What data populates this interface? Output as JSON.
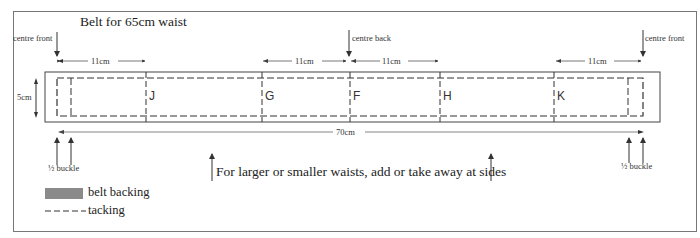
{
  "title": "Belt for 65cm waist",
  "labels": {
    "centre_front_left": "centre front",
    "centre_back": "centre back",
    "centre_front_right": "centre front",
    "height": "5cm",
    "total_length": "70cm",
    "half_buckle_left": "½ buckle",
    "half_buckle_right": "½ buckle",
    "note": "For larger or smaller waists, add or take away at sides"
  },
  "dimensions": [
    {
      "id": "front-left",
      "label": "11cm"
    },
    {
      "id": "back-left",
      "label": "11cm"
    },
    {
      "id": "back-right",
      "label": "11cm"
    },
    {
      "id": "front-right",
      "label": "11cm"
    }
  ],
  "markers": [
    "J",
    "G",
    "F",
    "H",
    "K"
  ],
  "legend": [
    {
      "label": "belt backing",
      "swatch": "#8a8a8a",
      "type": "fill"
    },
    {
      "label": "tacking",
      "type": "dashed-line"
    }
  ],
  "colors": {
    "line": "#333333",
    "swatch": "#8a8a8a"
  }
}
